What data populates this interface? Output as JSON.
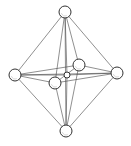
{
  "diagram": {
    "atoms": [
      {
        "id": "top",
        "role": "ligand"
      },
      {
        "id": "left",
        "role": "ligand"
      },
      {
        "id": "right",
        "role": "ligand"
      },
      {
        "id": "bottom",
        "role": "ligand"
      },
      {
        "id": "back",
        "role": "ligand"
      },
      {
        "id": "front",
        "role": "ligand"
      },
      {
        "id": "center",
        "role": "central-atom"
      }
    ],
    "bonds": [
      [
        "top",
        "left"
      ],
      [
        "top",
        "right"
      ],
      [
        "top",
        "back"
      ],
      [
        "top",
        "front"
      ],
      [
        "top",
        "center"
      ],
      [
        "top",
        "bottom"
      ],
      [
        "bottom",
        "left"
      ],
      [
        "bottom",
        "right"
      ],
      [
        "bottom",
        "back"
      ],
      [
        "bottom",
        "front"
      ],
      [
        "bottom",
        "center"
      ],
      [
        "left",
        "right"
      ],
      [
        "left",
        "back"
      ],
      [
        "left",
        "front"
      ],
      [
        "right",
        "back"
      ],
      [
        "right",
        "front"
      ],
      [
        "back",
        "front"
      ],
      [
        "left",
        "center"
      ],
      [
        "right",
        "center"
      ]
    ],
    "colors": {
      "line": "#444444",
      "atom_fill": "#ffffff",
      "atom_stroke": "#333333"
    }
  }
}
